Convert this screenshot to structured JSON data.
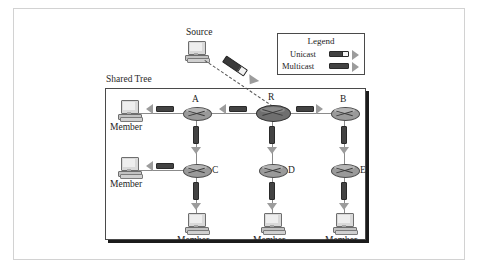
{
  "figure": {
    "tree_box_label": "Shared Tree",
    "source_label": "Source",
    "router_labels": {
      "r": "R",
      "a": "A",
      "b": "B",
      "c": "C",
      "d": "D",
      "e": "E"
    },
    "member_labels": [
      "Member",
      "Member",
      "Member",
      "Member",
      "Member"
    ]
  },
  "legend": {
    "title": "Legend",
    "rows": [
      {
        "label": "Unicast",
        "style": "bar-with-white-tip-and-arrow"
      },
      {
        "label": "Multicast",
        "style": "solid-bar-and-arrow"
      }
    ]
  },
  "colors": {
    "packet_bar": "#434343",
    "arrow_head": "#9c9c9c",
    "router_fill": "#9a9a9a",
    "router_root_fill": "#6f6f6f",
    "link_line": "#8b8b8b",
    "box_border": "#4a4a4a",
    "page_frame": "#d2d2d2"
  },
  "icons": {
    "computer": "computer-icon",
    "router": "router-icon"
  }
}
